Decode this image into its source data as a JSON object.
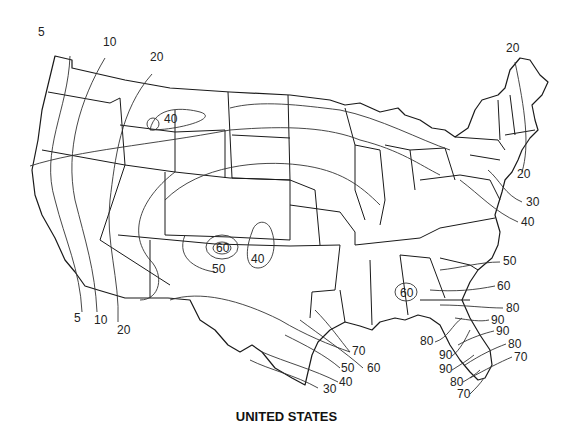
{
  "caption": "UNITED STATES",
  "colors": {
    "line": "#1a1a1a",
    "background": "#ffffff"
  },
  "isolines": {
    "labels": [
      {
        "id": "w5_top",
        "value": "5",
        "x": 38,
        "y": 36
      },
      {
        "id": "w10_top",
        "value": "10",
        "x": 103,
        "y": 46
      },
      {
        "id": "w20_top",
        "value": "20",
        "x": 150,
        "y": 61
      },
      {
        "id": "mt40",
        "value": "40",
        "x": 164,
        "y": 123
      },
      {
        "id": "w5_bot",
        "value": "5",
        "x": 74,
        "y": 322
      },
      {
        "id": "w10_bot",
        "value": "10",
        "x": 94,
        "y": 324
      },
      {
        "id": "w20_bot",
        "value": "20",
        "x": 117,
        "y": 334
      },
      {
        "id": "co60",
        "value": "60",
        "x": 216,
        "y": 252
      },
      {
        "id": "co50",
        "value": "50",
        "x": 212,
        "y": 273
      },
      {
        "id": "ok40",
        "value": "40",
        "x": 251,
        "y": 263
      },
      {
        "id": "tx70",
        "value": "70",
        "x": 352,
        "y": 355
      },
      {
        "id": "tx50",
        "value": "50",
        "x": 341,
        "y": 372
      },
      {
        "id": "tx60",
        "value": "60",
        "x": 367,
        "y": 372
      },
      {
        "id": "tx40",
        "value": "40",
        "x": 339,
        "y": 386
      },
      {
        "id": "tx30",
        "value": "30",
        "x": 323,
        "y": 393
      },
      {
        "id": "ne20",
        "value": "20",
        "x": 506,
        "y": 52
      },
      {
        "id": "ne20b",
        "value": "20",
        "x": 517,
        "y": 178
      },
      {
        "id": "ma30",
        "value": "30",
        "x": 526,
        "y": 206
      },
      {
        "id": "va40",
        "value": "40",
        "x": 521,
        "y": 226
      },
      {
        "id": "ga60",
        "value": "60",
        "x": 400,
        "y": 297
      },
      {
        "id": "sc50",
        "value": "50",
        "x": 503,
        "y": 265
      },
      {
        "id": "ga60b",
        "value": "60",
        "x": 497,
        "y": 290
      },
      {
        "id": "fl80a",
        "value": "80",
        "x": 506,
        "y": 312
      },
      {
        "id": "fl90a",
        "value": "90",
        "x": 491,
        "y": 324
      },
      {
        "id": "fl90b",
        "value": "90",
        "x": 496,
        "y": 335
      },
      {
        "id": "fl80b",
        "value": "80",
        "x": 508,
        "y": 348
      },
      {
        "id": "fl70a",
        "value": "70",
        "x": 514,
        "y": 361
      },
      {
        "id": "fl80c",
        "value": "80",
        "x": 420,
        "y": 345
      },
      {
        "id": "fl90c",
        "value": "90",
        "x": 439,
        "y": 359
      },
      {
        "id": "fl90d",
        "value": "90",
        "x": 439,
        "y": 373
      },
      {
        "id": "fl80d",
        "value": "80",
        "x": 450,
        "y": 386
      },
      {
        "id": "fl70b",
        "value": "70",
        "x": 457,
        "y": 398
      }
    ]
  }
}
